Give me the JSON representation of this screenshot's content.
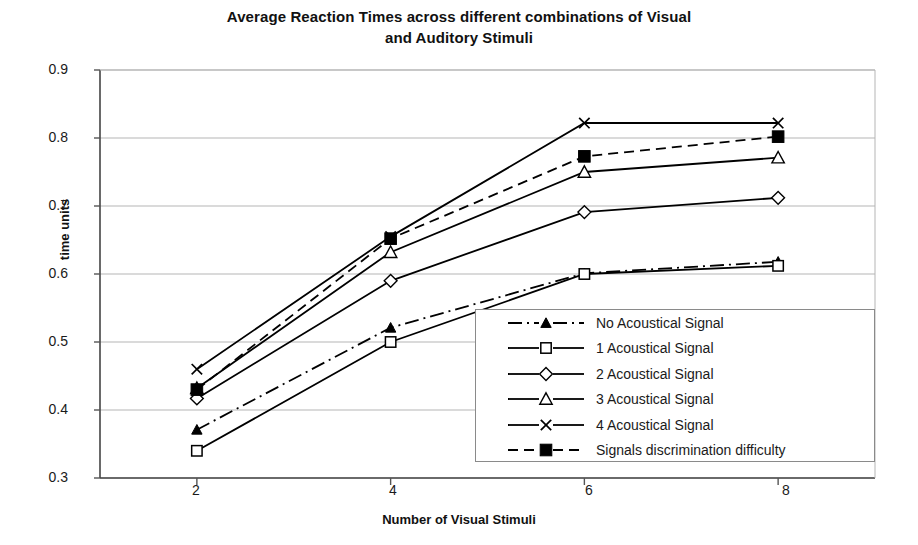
{
  "chart_data": {
    "type": "line",
    "title": "Average Reaction Times across different combinations of Visual and Auditory Stimuli",
    "title_line1": "Average Reaction Times across different combinations of Visual",
    "title_line2": "and Auditory Stimuli",
    "xlabel": "Number of Visual Stimuli",
    "ylabel": "time units",
    "x": [
      2,
      4,
      6,
      8
    ],
    "xticklabels": [
      "2",
      "4",
      "6",
      "8"
    ],
    "yticklabels": [
      "0.9",
      "0.8",
      "0.7",
      "0.6",
      "0.5",
      "0.4",
      "0.3"
    ],
    "xlim": [
      1,
      9
    ],
    "ylim": [
      0.3,
      0.9
    ],
    "grid": "horizontal",
    "legend_position": "lower-right-inside",
    "series": [
      {
        "name": "No Acoustical Signal",
        "marker": "filled-triangle",
        "linestyle": "dash-dot",
        "color": "#000000",
        "values": [
          0.371,
          0.521,
          0.601,
          0.618
        ]
      },
      {
        "name": "1 Acoustical Signal",
        "marker": "open-square",
        "linestyle": "solid",
        "color": "#000000",
        "values": [
          0.34,
          0.5,
          0.6,
          0.612
        ]
      },
      {
        "name": "2 Acoustical Signal",
        "marker": "open-diamond",
        "linestyle": "solid",
        "color": "#000000",
        "values": [
          0.417,
          0.59,
          0.691,
          0.712
        ]
      },
      {
        "name": "3 Acoustical Signal",
        "marker": "open-triangle",
        "linestyle": "solid",
        "color": "#000000",
        "values": [
          0.432,
          0.632,
          0.75,
          0.771
        ]
      },
      {
        "name": "4 Acoustical Signal",
        "marker": "cross-x",
        "linestyle": "solid",
        "color": "#000000",
        "values": [
          0.46,
          0.655,
          0.822,
          0.822
        ]
      },
      {
        "name": "Signals discrimination difficulty",
        "marker": "filled-square",
        "linestyle": "dashed",
        "color": "#000000",
        "values": [
          0.43,
          0.652,
          0.773,
          0.802
        ]
      }
    ]
  },
  "colors": {
    "ink": "#000000",
    "grid": "#b5b5b5",
    "axis": "#555555",
    "background": "#ffffff"
  }
}
